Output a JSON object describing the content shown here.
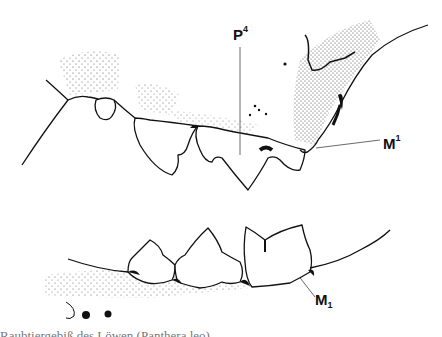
{
  "diagram": {
    "labels": {
      "p4": {
        "base": "P",
        "sup": "4"
      },
      "m_upper": {
        "base": "M",
        "sup": "1"
      },
      "m_lower": {
        "base": "M",
        "sub": "1"
      }
    },
    "caption": "Raubtiergebiß des Löwen (Panthera leo)",
    "caption_note": "Caption is clipped at the bottom edge and not legible in the screenshot; text shown is a best-guess reconstruction, not a confirmed reading.",
    "colors": {
      "ink": "#111111",
      "background": "#ffffff",
      "caption": "#777777"
    }
  }
}
